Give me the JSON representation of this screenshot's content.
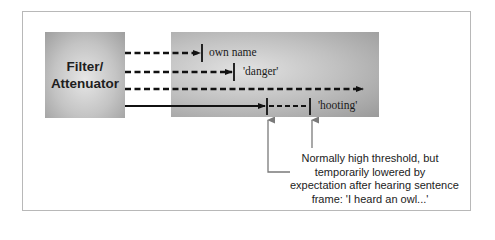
{
  "diagram": {
    "type": "attenuation-model-flow",
    "filter_box": {
      "label_line1": "Filter/",
      "label_line2": "Attenuator"
    },
    "channels": [
      {
        "style": "dashed",
        "y": 53,
        "x_start": 125,
        "threshold_x": 202,
        "label": "own name"
      },
      {
        "style": "dashed",
        "y": 72,
        "x_start": 125,
        "threshold_x": 234,
        "label": "'danger'"
      },
      {
        "style": "dashed",
        "y": 89,
        "x_start": 125,
        "arrow_end_x": 363,
        "label": ""
      },
      {
        "style": "solid-then-dashed",
        "y": 106,
        "x_start": 125,
        "lowered_threshold_x": 267,
        "normal_threshold_x": 310,
        "label": "'hooting'"
      }
    ],
    "annotation": {
      "lines": [
        "Normally high threshold, but",
        "temporarily lowered by",
        "expectation after hearing sentence",
        "frame: 'I heard an owl...'"
      ]
    },
    "colors": {
      "line": "#111111",
      "arrow_gray": "#7a7a7a",
      "frame_border": "#b8b8b8",
      "box_gray": "#a8a8a8"
    }
  }
}
